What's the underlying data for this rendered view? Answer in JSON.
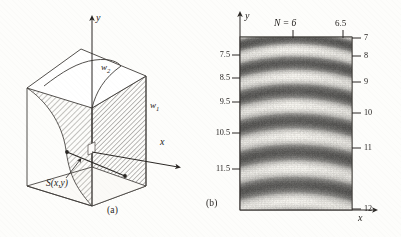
{
  "figure": {
    "panel_a": {
      "caption": "(a)",
      "axis_y_label": "y",
      "axis_x_label": "x",
      "surface_label": "S(x,y)",
      "region_label_1": "w",
      "region_label_1_sub": "1",
      "region_label_2": "w",
      "region_label_2_sub": "2",
      "description": "Three-dimensional box containing a hatched curved surface S(x,y) separating regions w1 and w2"
    },
    "panel_b": {
      "caption": "(b)",
      "axis_y_label": "y",
      "axis_x_label": "x",
      "order_label": "N = 6",
      "order_label_secondary": "6.5",
      "left_ticks": [
        "7.5",
        "8.5",
        "9.5",
        "10.5",
        "11.5"
      ],
      "right_ticks": [
        "7",
        "8",
        "9",
        "10",
        "11",
        "12"
      ]
    }
  },
  "chart_data": {
    "type": "heatmap",
    "title": "",
    "xlabel": "x",
    "ylabel": "y",
    "grid": false,
    "legend": null,
    "annotations": [
      "N = 6",
      "6.5"
    ],
    "left_axis_ticks": {
      "labels": [
        "7.5",
        "8.5",
        "9.5",
        "10.5",
        "11.5"
      ],
      "positions_fraction": [
        0.105,
        0.235,
        0.375,
        0.555,
        0.76
      ]
    },
    "right_axis_ticks": {
      "labels": [
        "7",
        "8",
        "9",
        "10",
        "11",
        "12"
      ],
      "positions_fraction": [
        0.0,
        0.105,
        0.255,
        0.44,
        0.64,
        0.98
      ]
    },
    "top_axis_ticks": {
      "labels": [
        "N = 6",
        "6.5"
      ],
      "positions_fraction": [
        0.47,
        0.92
      ]
    },
    "fringe_orders": [
      6,
      6.5,
      7,
      7.5,
      8,
      8.5,
      9,
      9.5,
      10,
      10.5,
      11,
      11.5,
      12
    ],
    "fringe_arc_centers_y_fraction": [
      0.02,
      0.145,
      0.3,
      0.475,
      0.665,
      0.885
    ],
    "fringe_curvature": "arcs concave upward, deepest at plot center in x",
    "colormap": "grayscale, dark bands at integer fringe orders",
    "value_range": [
      6,
      12
    ],
    "xlim": [
      0,
      1
    ],
    "ylim": [
      12,
      6
    ]
  }
}
